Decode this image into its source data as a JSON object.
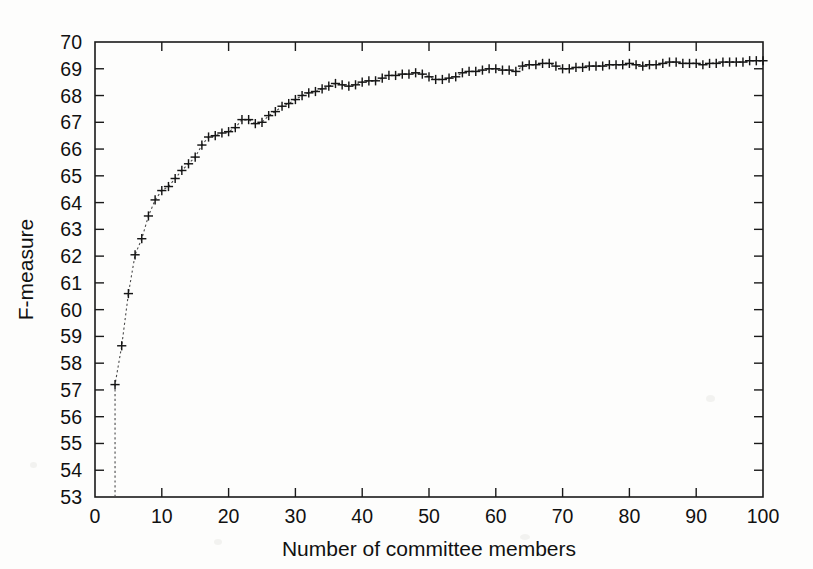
{
  "figure": {
    "background_color": "#fdfdfc",
    "ink_color": "#161616",
    "marker_symbol": "+"
  },
  "chart_data": {
    "type": "line",
    "title": "",
    "subtitle": "",
    "xlabel": "Number of committee members",
    "ylabel": "F-measure",
    "xlim": [
      0,
      100
    ],
    "ylim": [
      53,
      70
    ],
    "xticks": [
      0,
      10,
      20,
      30,
      40,
      50,
      60,
      70,
      80,
      90,
      100
    ],
    "yticks": [
      53,
      54,
      55,
      56,
      57,
      58,
      59,
      60,
      61,
      62,
      63,
      64,
      65,
      66,
      67,
      68,
      69,
      70
    ],
    "xtick_labels": [
      "0",
      "10",
      "20",
      "30",
      "40",
      "50",
      "60",
      "70",
      "80",
      "90",
      "100"
    ],
    "ytick_labels": [
      "53",
      "54",
      "55",
      "56",
      "57",
      "58",
      "59",
      "60",
      "61",
      "62",
      "63",
      "64",
      "65",
      "66",
      "67",
      "68",
      "69",
      "70"
    ],
    "grid": false,
    "legend": null,
    "legend_position": "none",
    "marker": "+",
    "linestyle": "dotted",
    "line_color": "#4a4a4a",
    "marker_color": "#161616",
    "annotations": [],
    "series": [
      {
        "name": "F-measure",
        "x": [
          3,
          4,
          5,
          6,
          7,
          8,
          9,
          10,
          11,
          12,
          13,
          14,
          15,
          16,
          17,
          18,
          19,
          20,
          21,
          22,
          23,
          24,
          25,
          26,
          27,
          28,
          29,
          30,
          31,
          32,
          33,
          34,
          35,
          36,
          37,
          38,
          39,
          40,
          41,
          42,
          43,
          44,
          45,
          46,
          47,
          48,
          49,
          50,
          51,
          52,
          53,
          54,
          55,
          56,
          57,
          58,
          59,
          60,
          61,
          62,
          63,
          64,
          65,
          66,
          67,
          68,
          69,
          70,
          71,
          72,
          73,
          74,
          75,
          76,
          77,
          78,
          79,
          80,
          81,
          82,
          83,
          84,
          85,
          86,
          87,
          88,
          89,
          90,
          91,
          92,
          93,
          94,
          95,
          96,
          97,
          98,
          99,
          100
        ],
        "y": [
          57.2,
          58.65,
          60.6,
          62.05,
          62.65,
          63.5,
          64.1,
          64.45,
          64.6,
          64.9,
          65.2,
          65.45,
          65.7,
          66.15,
          66.45,
          66.5,
          66.6,
          66.65,
          66.8,
          67.1,
          67.1,
          66.95,
          67.0,
          67.25,
          67.4,
          67.6,
          67.7,
          67.85,
          68.0,
          68.1,
          68.15,
          68.25,
          68.35,
          68.45,
          68.4,
          68.35,
          68.4,
          68.5,
          68.55,
          68.55,
          68.65,
          68.75,
          68.75,
          68.8,
          68.8,
          68.85,
          68.8,
          68.7,
          68.6,
          68.6,
          68.65,
          68.7,
          68.85,
          68.9,
          68.9,
          68.95,
          69.0,
          69.0,
          68.95,
          68.95,
          68.9,
          69.1,
          69.15,
          69.15,
          69.2,
          69.2,
          69.1,
          69.0,
          69.0,
          69.05,
          69.05,
          69.1,
          69.1,
          69.1,
          69.15,
          69.15,
          69.15,
          69.2,
          69.15,
          69.1,
          69.15,
          69.15,
          69.2,
          69.25,
          69.25,
          69.2,
          69.2,
          69.2,
          69.15,
          69.2,
          69.2,
          69.25,
          69.25,
          69.25,
          69.25,
          69.3,
          69.3,
          69.3
        ]
      }
    ]
  },
  "geometry": {
    "plot_left_px": 95,
    "plot_right_px": 763,
    "plot_top_px": 42,
    "plot_bottom_px": 497
  }
}
